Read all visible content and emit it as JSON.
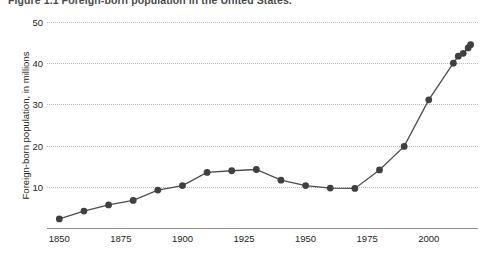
{
  "figure": {
    "title": "Figure 1.1  Foreign-born population in the United States."
  },
  "axes": {
    "y_title": "Foreign-born population, in millions",
    "y_ticks": [
      "50",
      "40",
      "30",
      "20",
      "10"
    ],
    "x_ticks": [
      "1850",
      "1875",
      "1900",
      "1925",
      "1950",
      "1975",
      "2000"
    ]
  },
  "style": {
    "line_color": "#4d4d4d",
    "marker_color": "#404040",
    "grid_color": "#b9b9b9",
    "axis_color": "#8c8c8c",
    "text_color": "#231f20"
  },
  "chart_data": {
    "type": "line",
    "title": "Figure 1.1  Foreign-born population in the United States.",
    "xlabel": "",
    "ylabel": "Foreign-born population, in millions",
    "xlim": [
      1845,
      2020
    ],
    "ylim": [
      0,
      50
    ],
    "yticks": [
      10,
      20,
      30,
      40,
      50
    ],
    "xticks": [
      1850,
      1875,
      1900,
      1925,
      1950,
      1975,
      2000
    ],
    "grid": "horizontal-dotted",
    "legend": "none",
    "markers": "filled-circle",
    "series": [
      {
        "name": "Foreign-born population",
        "x": [
          1850,
          1860,
          1870,
          1880,
          1890,
          1900,
          1910,
          1920,
          1930,
          1940,
          1950,
          1960,
          1970,
          1980,
          1990,
          2000,
          2010,
          2012,
          2014,
          2016,
          2017
        ],
        "values": [
          2.2,
          4.1,
          5.6,
          6.7,
          9.2,
          10.3,
          13.5,
          13.9,
          14.2,
          11.6,
          10.3,
          9.7,
          9.6,
          14.1,
          19.8,
          31.1,
          40.0,
          41.7,
          42.4,
          43.7,
          44.5
        ]
      }
    ]
  }
}
